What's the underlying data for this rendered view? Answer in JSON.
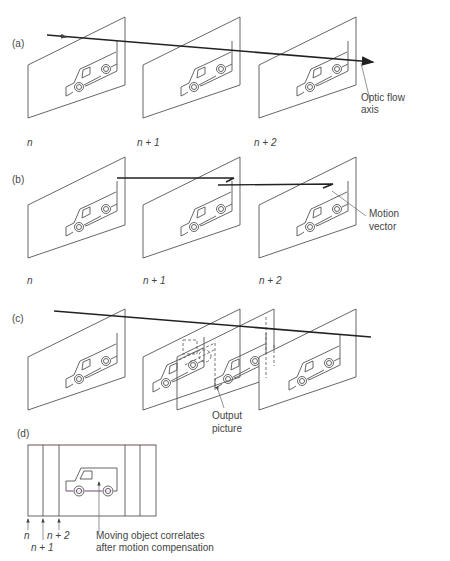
{
  "panels": {
    "a": {
      "label": "(a)",
      "frames": [
        "n",
        "n + 1",
        "n + 2"
      ],
      "annotation_line1": "Optic flow",
      "annotation_line2": "axis"
    },
    "b": {
      "label": "(b)",
      "frames": [
        "n",
        "n + 1",
        "n + 2"
      ],
      "annotation_line1": "Motion",
      "annotation_line2": "vector"
    },
    "c": {
      "label": "(c)",
      "annotation_line1": "Output",
      "annotation_line2": "picture"
    },
    "d": {
      "label": "(d)",
      "frame_labels": [
        "n",
        "n + 1",
        "n + 2"
      ],
      "annotation_line1": "Moving object correlates",
      "annotation_line2": "after motion compensation"
    }
  },
  "colors": {
    "stroke": "#555555",
    "axis": "#222222",
    "text": "#444444"
  }
}
